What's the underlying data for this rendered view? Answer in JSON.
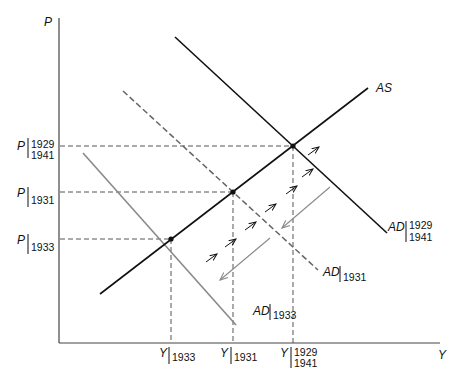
{
  "diagram": {
    "type": "AD-AS macroeconomic diagram",
    "axes": {
      "y_label": "P",
      "x_label": "Y"
    },
    "curves": {
      "AS": {
        "label": "AS"
      },
      "AD_1929": {
        "label": "AD",
        "sub1": "1929",
        "sub2": "1941"
      },
      "AD_1931": {
        "label": "AD",
        "sub1": "1931"
      },
      "AD_1933": {
        "label": "AD",
        "sub1": "1933"
      }
    },
    "price_levels": [
      {
        "label": "P",
        "sub1": "1929",
        "sub2": "1941"
      },
      {
        "label": "P",
        "sub1": "1931"
      },
      {
        "label": "P",
        "sub1": "1933"
      }
    ],
    "output_levels": [
      {
        "label": "Y",
        "sub1": "1933"
      },
      {
        "label": "Y",
        "sub1": "1931"
      },
      {
        "label": "Y",
        "sub1": "1929",
        "sub2": "1941"
      }
    ],
    "colors": {
      "solid": "#111111",
      "gray": "#8a8a8a",
      "dashed": "#555555"
    }
  }
}
